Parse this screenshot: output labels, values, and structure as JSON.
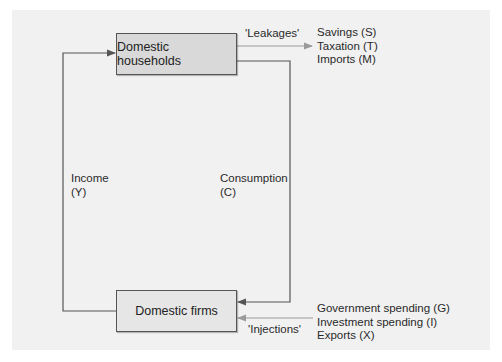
{
  "diagram": {
    "nodes": {
      "households": "Domestic households",
      "firms": "Domestic firms"
    },
    "flows": {
      "income": {
        "label": "Income",
        "symbol": "(Y)"
      },
      "consumption": {
        "label": "Consumption",
        "symbol": "(C)"
      }
    },
    "leakages": {
      "label": "'Leakages'",
      "items": [
        "Savings (S)",
        "Taxation (T)",
        "Imports (M)"
      ]
    },
    "injections": {
      "label": "'Injections'",
      "items": [
        "Government spending (G)",
        "Investment spending (I)",
        "Exports (X)"
      ]
    },
    "colors": {
      "panel": "#f1f1f1",
      "households_fill": "#d9d9d9",
      "firms_fill": "#e6e6e6",
      "main_line": "#555555",
      "leak_inject_line": "#9a9a9a"
    }
  }
}
